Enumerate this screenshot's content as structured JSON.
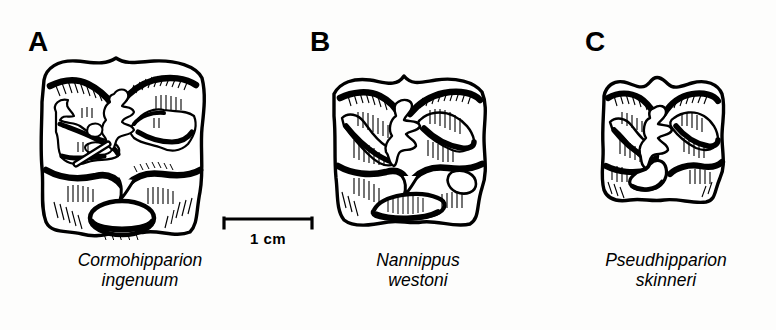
{
  "figure": {
    "type": "scientific-line-drawing",
    "background_color": "#fdfdfc",
    "ink_color": "#000000",
    "panel_count": 3
  },
  "scale": {
    "label": "1 cm",
    "length_px": 92,
    "position": "between panel A and panel B, below tooth A"
  },
  "panels": [
    {
      "letter": "A",
      "genus": "Cormohipparion",
      "species": "ingenuum",
      "relative_size": "largest",
      "tooth_width_px": 186,
      "tooth_height_px": 188
    },
    {
      "letter": "B",
      "genus": "Nannippus",
      "species": "westoni",
      "relative_size": "medium",
      "tooth_width_px": 170,
      "tooth_height_px": 164
    },
    {
      "letter": "C",
      "genus": "Pseudhipparion",
      "species": "skinneri",
      "relative_size": "smallest",
      "tooth_width_px": 136,
      "tooth_height_px": 140
    }
  ]
}
